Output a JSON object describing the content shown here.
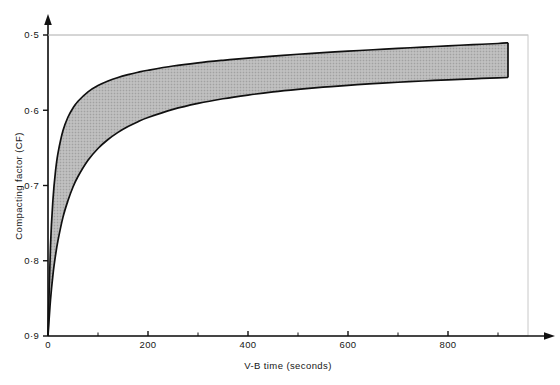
{
  "chart_data": {
    "type": "area",
    "title": "",
    "subtitle": "",
    "xlabel": "V-B  time (seconds)",
    "ylabel": "Compacting factor (CF)",
    "xlim": [
      0,
      960
    ],
    "ylim": [
      0.9,
      0.5
    ],
    "y_inverted": true,
    "grid": false,
    "legend": "none",
    "xticks": [
      0,
      200,
      400,
      600,
      800
    ],
    "xtick_labels": [
      "0",
      "200",
      "400",
      "600",
      "800"
    ],
    "x_minor_ticks": [
      100,
      300,
      500,
      700,
      900
    ],
    "yticks": [
      0.5,
      0.6,
      0.7,
      0.8,
      0.9
    ],
    "ytick_labels": [
      "0·5",
      "0·6",
      "0·7",
      "0·8",
      "0·9"
    ],
    "band_fill_color": "#b4b4b4",
    "band_line_color": "#101010",
    "axis_color": "#111111",
    "frame_color": "#c8c8c8",
    "series": [
      {
        "name": "upper envelope (lowest CF)",
        "x": [
          0,
          5,
          10,
          15,
          20,
          30,
          40,
          50,
          60,
          80,
          100,
          120,
          140,
          160,
          180,
          200,
          250,
          300,
          350,
          400,
          450,
          500,
          550,
          600,
          650,
          700,
          750,
          800,
          850,
          900,
          920
        ],
        "values": [
          0.9,
          0.78,
          0.718,
          0.681,
          0.657,
          0.627,
          0.609,
          0.597,
          0.588,
          0.5755,
          0.5672,
          0.5611,
          0.5564,
          0.5527,
          0.5495,
          0.5468,
          0.5412,
          0.537,
          0.5336,
          0.5306,
          0.528,
          0.5256,
          0.5235,
          0.5215,
          0.5196,
          0.5178,
          0.5161,
          0.5144,
          0.5128,
          0.5113,
          0.5104
        ]
      },
      {
        "name": "lower envelope (highest CF)",
        "x": [
          0,
          5,
          10,
          15,
          20,
          30,
          40,
          50,
          60,
          80,
          100,
          120,
          140,
          160,
          180,
          200,
          250,
          300,
          350,
          400,
          450,
          500,
          550,
          600,
          650,
          700,
          750,
          800,
          850,
          900,
          920
        ],
        "values": [
          0.9,
          0.852,
          0.818,
          0.793,
          0.773,
          0.742,
          0.72,
          0.702,
          0.688,
          0.6665,
          0.6508,
          0.6389,
          0.6294,
          0.6217,
          0.6152,
          0.6097,
          0.5989,
          0.5909,
          0.5847,
          0.5798,
          0.5757,
          0.5723,
          0.5694,
          0.5669,
          0.5647,
          0.5628,
          0.5611,
          0.5596,
          0.5582,
          0.557,
          0.5565
        ]
      }
    ],
    "annotations": []
  },
  "figure": {
    "x_axis_name": "x-axis",
    "y_axis_name": "y-axis"
  }
}
